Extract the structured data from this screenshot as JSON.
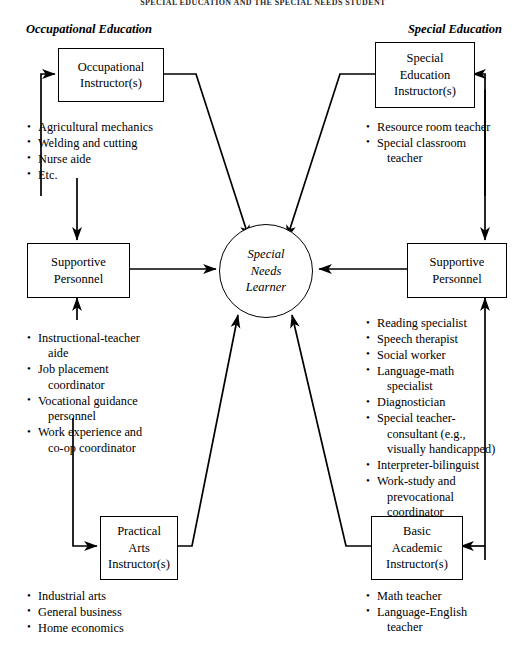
{
  "page": {
    "running_head": "SPECIAL EDUCATION AND THE SPECIAL NEEDS STUDENT"
  },
  "sections": {
    "left_label": "Occupational Education",
    "right_label": "Special Education"
  },
  "center": {
    "line1": "Special",
    "line2": "Needs",
    "line3": "Learner"
  },
  "boxes": {
    "occupational_instructor": {
      "lines": [
        "Occupational",
        "Instructor(s)"
      ]
    },
    "left_supportive": {
      "lines": [
        "Supportive",
        "Personnel"
      ]
    },
    "practical_arts": {
      "lines": [
        "Practical",
        "Arts",
        "Instructor(s)"
      ]
    },
    "special_education_instructor": {
      "lines": [
        "Special",
        "Education",
        "Instructor(s)"
      ]
    },
    "right_supportive": {
      "lines": [
        "Supportive",
        "Personnel"
      ]
    },
    "basic_academic": {
      "lines": [
        "Basic",
        "Academic",
        "Instructor(s)"
      ]
    }
  },
  "lists": {
    "occupational_instructor_items": [
      {
        "main": "Agricultural mechanics",
        "cont": ""
      },
      {
        "main": "Welding and cutting",
        "cont": ""
      },
      {
        "main": "Nurse aide",
        "cont": ""
      },
      {
        "main": "Etc.",
        "cont": ""
      }
    ],
    "left_supportive_items": [
      {
        "main": "Instructional-teacher",
        "cont": "aide"
      },
      {
        "main": "Job placement",
        "cont": "coordinator"
      },
      {
        "main": "Vocational guidance",
        "cont": "personnel"
      },
      {
        "main": "Work experience and",
        "cont": "co-op coordinator"
      }
    ],
    "practical_arts_items": [
      {
        "main": "Industrial arts",
        "cont": ""
      },
      {
        "main": "General business",
        "cont": ""
      },
      {
        "main": "Home economics",
        "cont": ""
      }
    ],
    "special_education_instructor_items": [
      {
        "main": "Resource room teacher",
        "cont": ""
      },
      {
        "main": "Special classroom",
        "cont": "teacher"
      }
    ],
    "right_supportive_items": [
      {
        "main": "Reading specialist",
        "cont": ""
      },
      {
        "main": "Speech therapist",
        "cont": ""
      },
      {
        "main": "Social worker",
        "cont": ""
      },
      {
        "main": "Language-math",
        "cont": "specialist"
      },
      {
        "main": "Diagnostician",
        "cont": ""
      },
      {
        "main": "Special teacher-",
        "cont": "consultant (e.g.,\nvisually handicapped)"
      },
      {
        "main": "Interpreter-bilinguist",
        "cont": ""
      },
      {
        "main": "Work-study and",
        "cont": "prevocational\ncoordinator"
      }
    ],
    "basic_academic_items": [
      {
        "main": "Math teacher",
        "cont": ""
      },
      {
        "main": "Language-English",
        "cont": "teacher"
      }
    ]
  },
  "colors": {
    "ink": "#000000",
    "paper": "#ffffff"
  }
}
